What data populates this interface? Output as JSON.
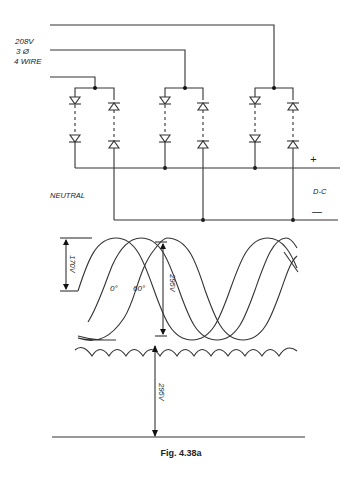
{
  "figure": {
    "caption": "Fig. 4.38a",
    "supply_label_line1": "208V",
    "supply_label_line2": "3 Ø",
    "supply_label_line3": "4 WIRE",
    "neutral_label": "NEUTRAL",
    "dc_label": "D-C",
    "plus_label": "+",
    "minus_label": "—",
    "waveform": {
      "peak_label": "170V",
      "pp_label": "295V",
      "angle_label_1": "0°",
      "angle_label_2": "60°",
      "dc_output_label": "295V"
    }
  },
  "colors": {
    "line": "#333333",
    "background": "#ffffff"
  }
}
